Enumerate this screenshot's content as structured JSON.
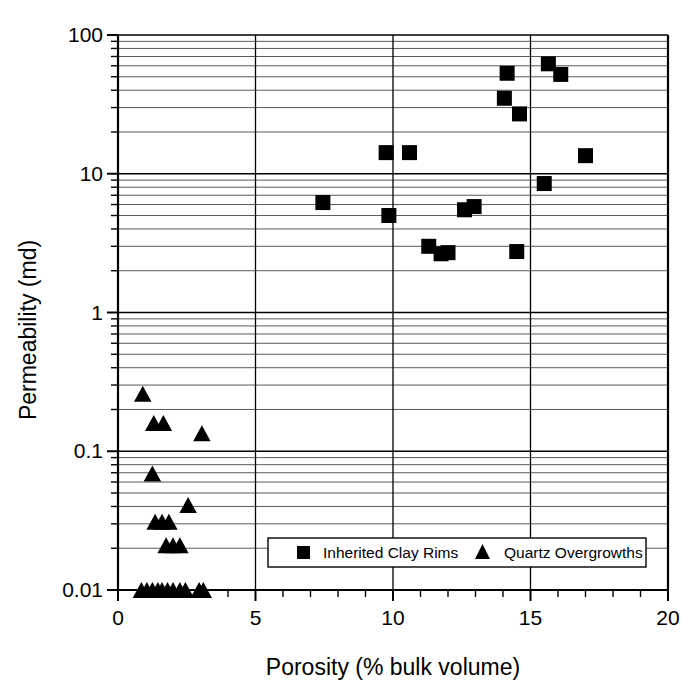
{
  "chart_data": {
    "type": "scatter",
    "title": "",
    "xlabel": "Porosity (% bulk volume)",
    "ylabel": "Permeability (md)",
    "xlim": [
      0,
      20
    ],
    "ylim": [
      0.01,
      100
    ],
    "xscale": "linear",
    "yscale": "log",
    "xticks": [
      0,
      5,
      10,
      15,
      20
    ],
    "xticklabels": [
      "0",
      "5",
      "10",
      "15",
      "20"
    ],
    "x_minor_tick_step": 1,
    "yticks": [
      0.01,
      0.1,
      1,
      10,
      100
    ],
    "yticklabels": [
      "0.01",
      "0.1",
      "1",
      "10",
      "100"
    ],
    "grid": "major-and-minor-horizontal, major-vertical",
    "legend_position": "lower-center-inside",
    "series": [
      {
        "name": "Inherited Clay Rims",
        "marker": "square",
        "color": "#000000",
        "points": [
          [
            7.45,
            6.2
          ],
          [
            9.75,
            14.2
          ],
          [
            9.85,
            5.0
          ],
          [
            10.6,
            14.2
          ],
          [
            11.3,
            3.0
          ],
          [
            11.75,
            2.65
          ],
          [
            12.0,
            2.7
          ],
          [
            12.6,
            5.5
          ],
          [
            12.95,
            5.8
          ],
          [
            14.05,
            35.0
          ],
          [
            14.15,
            53.0
          ],
          [
            14.5,
            2.75
          ],
          [
            14.6,
            27.0
          ],
          [
            15.5,
            8.5
          ],
          [
            15.65,
            62.0
          ],
          [
            16.1,
            52.0
          ],
          [
            17.0,
            13.5
          ]
        ]
      },
      {
        "name": "Quartz Overgrowths",
        "marker": "triangle",
        "color": "#000000",
        "points": [
          [
            0.9,
            0.26
          ],
          [
            1.3,
            0.16
          ],
          [
            1.65,
            0.16
          ],
          [
            3.05,
            0.135
          ],
          [
            1.25,
            0.069
          ],
          [
            2.55,
            0.041
          ],
          [
            1.35,
            0.031
          ],
          [
            1.6,
            0.031
          ],
          [
            1.85,
            0.031
          ],
          [
            1.75,
            0.021
          ],
          [
            2.0,
            0.021
          ],
          [
            2.25,
            0.021
          ],
          [
            0.85,
            0.01
          ],
          [
            1.05,
            0.01
          ],
          [
            1.25,
            0.01
          ],
          [
            1.45,
            0.01
          ],
          [
            1.6,
            0.01
          ],
          [
            1.8,
            0.01
          ],
          [
            2.0,
            0.01
          ],
          [
            2.25,
            0.01
          ],
          [
            2.45,
            0.01
          ],
          [
            2.95,
            0.01
          ],
          [
            3.1,
            0.01
          ]
        ]
      }
    ],
    "legend": [
      {
        "label": "Inherited Clay Rims",
        "marker": "square"
      },
      {
        "label": "Quartz Overgrowths",
        "marker": "triangle"
      }
    ]
  }
}
